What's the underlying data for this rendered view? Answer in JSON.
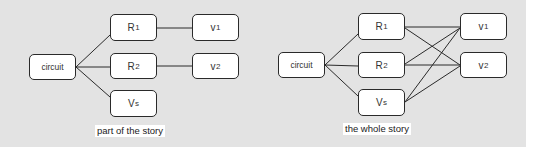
{
  "diagrams": [
    {
      "caption": "part of the story",
      "nodes": {
        "circuit": {
          "label": "circuit"
        },
        "r1": {
          "base": "R",
          "sub": "1"
        },
        "r2": {
          "base": "R",
          "sub": "2"
        },
        "vs": {
          "base": "V",
          "sub": "s"
        },
        "v1": {
          "base": "v",
          "sub": "1"
        },
        "v2": {
          "base": "v",
          "sub": "2"
        }
      },
      "edges": [
        [
          "circuit",
          "R1"
        ],
        [
          "circuit",
          "R2"
        ],
        [
          "circuit",
          "Vs"
        ],
        [
          "R1",
          "v1"
        ],
        [
          "R2",
          "v2"
        ]
      ]
    },
    {
      "caption": "the whole story",
      "nodes": {
        "circuit": {
          "label": "circuit"
        },
        "r1": {
          "base": "R",
          "sub": "1"
        },
        "r2": {
          "base": "R",
          "sub": "2"
        },
        "vs": {
          "base": "V",
          "sub": "s"
        },
        "v1": {
          "base": "v",
          "sub": "1"
        },
        "v2": {
          "base": "v",
          "sub": "2"
        }
      },
      "edges": [
        [
          "circuit",
          "R1"
        ],
        [
          "circuit",
          "R2"
        ],
        [
          "circuit",
          "Vs"
        ],
        [
          "R1",
          "v1"
        ],
        [
          "R1",
          "v2"
        ],
        [
          "R2",
          "v1"
        ],
        [
          "R2",
          "v2"
        ],
        [
          "Vs",
          "v1"
        ],
        [
          "Vs",
          "v2"
        ]
      ]
    }
  ],
  "colors": {
    "background": "#e3e3e3",
    "node_fill": "#ffffff",
    "stroke": "#2a2a2a"
  }
}
